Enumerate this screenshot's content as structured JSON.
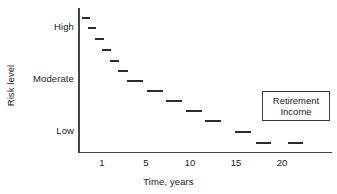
{
  "chart_data": {
    "type": "scatter",
    "title": "",
    "xlabel": "Time, years",
    "ylabel": "Risk level",
    "grid": false,
    "legend_position": "right",
    "annotations": [
      "Retirement Income"
    ],
    "x_ticks": [
      {
        "label": "1",
        "px": 102
      },
      {
        "label": "5",
        "px": 146
      },
      {
        "label": "10",
        "px": 190
      },
      {
        "label": "15",
        "px": 236
      },
      {
        "label": "20",
        "px": 282
      }
    ],
    "y_ticks": [
      {
        "label": "High",
        "px": 27
      },
      {
        "label": "Moderate",
        "px": 79
      },
      {
        "label": "Low",
        "px": 131
      }
    ],
    "xlim": [
      0,
      23
    ],
    "ylim_labels": [
      "Low",
      "Moderate",
      "High"
    ],
    "series": [
      {
        "name": "Retirement Income",
        "marker": "dash",
        "points": [
          {
            "x": 0.3,
            "y": "High",
            "px": 82,
            "py": 17,
            "w": 8
          },
          {
            "x": 0.6,
            "y": "High",
            "px": 88,
            "py": 27,
            "w": 8
          },
          {
            "x": 0.9,
            "y": "High-Moderate",
            "px": 95,
            "py": 38,
            "w": 9
          },
          {
            "x": 1.3,
            "y": "High-Moderate",
            "px": 102,
            "py": 49,
            "w": 9
          },
          {
            "x": 1.8,
            "y": "Moderate-High",
            "px": 110,
            "py": 60,
            "w": 9
          },
          {
            "x": 2.6,
            "y": "Moderate",
            "px": 118,
            "py": 70,
            "w": 10
          },
          {
            "x": 3.4,
            "y": "Moderate",
            "px": 127,
            "py": 80,
            "w": 16
          },
          {
            "x": 5.0,
            "y": "Moderate-Low",
            "px": 147,
            "py": 90,
            "w": 16
          },
          {
            "x": 7.2,
            "y": "Moderate-Low",
            "px": 166,
            "py": 100,
            "w": 16
          },
          {
            "x": 9.8,
            "y": "Low-Moderate",
            "px": 186,
            "py": 110,
            "w": 16
          },
          {
            "x": 11.8,
            "y": "Low",
            "px": 205,
            "py": 120,
            "w": 16
          },
          {
            "x": 14.8,
            "y": "Low",
            "px": 235,
            "py": 131,
            "w": 16
          },
          {
            "x": 17.0,
            "y": "Low",
            "px": 256,
            "py": 142,
            "w": 15
          },
          {
            "x": 19.3,
            "y": "Low",
            "px": 288,
            "py": 142,
            "w": 15
          }
        ]
      }
    ]
  },
  "legend": {
    "line1": "Retirement",
    "line2": "Income"
  }
}
